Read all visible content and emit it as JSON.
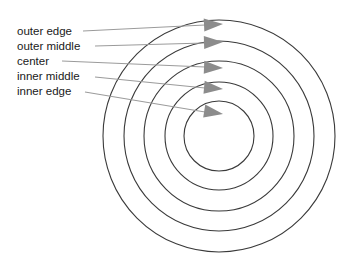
{
  "diagram": {
    "name": "concentric-rings-target",
    "background_color": "#ffffff",
    "ring_stroke_color": "#3a3a3a",
    "leader_color": "#9b9b9b",
    "arrowhead_color": "#8c8c8c",
    "label_color": "#1a1a1a",
    "center": {
      "x": 219,
      "y": 136
    },
    "rings": [
      {
        "name": "outer edge",
        "radius": 116
      },
      {
        "name": "outer middle",
        "radius": 95
      },
      {
        "name": "center",
        "radius": 75
      },
      {
        "name": "inner middle",
        "radius": 54
      },
      {
        "name": "inner edge",
        "radius": 35
      }
    ],
    "callouts": [
      {
        "label": "outer edge",
        "label_x": 17,
        "label_y": 35,
        "line_x1": 83,
        "line_y1": 31,
        "line_x2": 205,
        "line_y2": 25,
        "tip_x": 223,
        "tip_y": 24
      },
      {
        "label": "outer middle",
        "label_x": 17,
        "label_y": 50,
        "line_x1": 95,
        "line_y1": 46,
        "line_x2": 205,
        "line_y2": 43,
        "tip_x": 223,
        "tip_y": 42
      },
      {
        "label": "center",
        "label_x": 17,
        "label_y": 65,
        "line_x1": 62,
        "line_y1": 61,
        "line_x2": 205,
        "line_y2": 67,
        "tip_x": 223,
        "tip_y": 68
      },
      {
        "label": "inner middle",
        "label_x": 17,
        "label_y": 80,
        "line_x1": 95,
        "line_y1": 77,
        "line_x2": 205,
        "line_y2": 88,
        "tip_x": 223,
        "tip_y": 89
      },
      {
        "label": "inner edge",
        "label_x": 17,
        "label_y": 95,
        "line_x1": 85,
        "line_y1": 92,
        "line_x2": 205,
        "line_y2": 112,
        "tip_x": 223,
        "tip_y": 114
      }
    ]
  }
}
